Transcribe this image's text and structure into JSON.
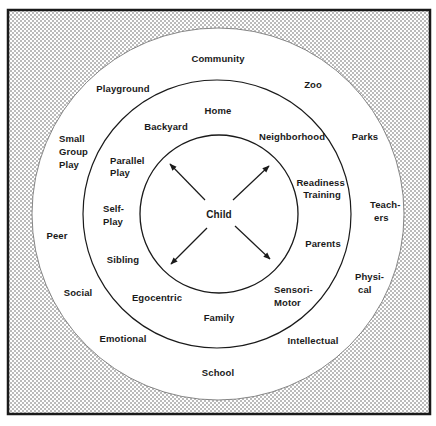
{
  "diagram": {
    "title": "",
    "center": {
      "label": "Child"
    },
    "colors": {
      "stipple": "#9a9a9a",
      "line": "#1a1a1a",
      "background": "#ffffff"
    },
    "rings": {
      "inner": {
        "labels": []
      },
      "middle": {
        "labels": [
          {
            "id": "home",
            "text": [
              "Home"
            ]
          },
          {
            "id": "backyard",
            "text": [
              "Backyard"
            ]
          },
          {
            "id": "neighborhood",
            "text": [
              "Neighborhood"
            ]
          },
          {
            "id": "parallel-play",
            "text": [
              "Parallel",
              "Play"
            ]
          },
          {
            "id": "readiness-training",
            "text": [
              "Readiness",
              "Training"
            ]
          },
          {
            "id": "self-play",
            "text": [
              "Self-",
              "Play"
            ]
          },
          {
            "id": "parents",
            "text": [
              "Parents"
            ]
          },
          {
            "id": "sibling",
            "text": [
              "Sibling"
            ]
          },
          {
            "id": "egocentric",
            "text": [
              "Egocentric"
            ]
          },
          {
            "id": "sensori-motor",
            "text": [
              "Sensori-",
              "Motor"
            ]
          },
          {
            "id": "family",
            "text": [
              "Family"
            ]
          }
        ]
      },
      "outer": {
        "labels": [
          {
            "id": "community",
            "text": [
              "Community"
            ]
          },
          {
            "id": "playground",
            "text": [
              "Playground"
            ]
          },
          {
            "id": "zoo",
            "text": [
              "Zoo"
            ]
          },
          {
            "id": "small-group-play",
            "text": [
              "Small",
              "Group",
              "Play"
            ]
          },
          {
            "id": "parks",
            "text": [
              "Parks"
            ]
          },
          {
            "id": "teachers",
            "text": [
              "Teach-",
              "ers"
            ]
          },
          {
            "id": "peer",
            "text": [
              "Peer"
            ]
          },
          {
            "id": "social",
            "text": [
              "Social"
            ]
          },
          {
            "id": "physical",
            "text": [
              "Physi-",
              "cal"
            ]
          },
          {
            "id": "emotional",
            "text": [
              "Emotional"
            ]
          },
          {
            "id": "intellectual",
            "text": [
              "Intellectual"
            ]
          },
          {
            "id": "school",
            "text": [
              "School"
            ]
          }
        ]
      }
    }
  }
}
